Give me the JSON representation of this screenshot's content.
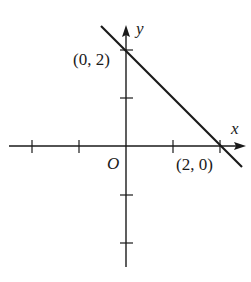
{
  "figure": {
    "type": "coordinate-plane line graph",
    "axes": {
      "x_label": "x",
      "y_label": "y",
      "origin_label": "O"
    },
    "points": [
      {
        "label": "(0, 2)",
        "x": 0,
        "y": 2
      },
      {
        "label": "(2, 0)",
        "x": 2,
        "y": 0
      }
    ],
    "ticks": {
      "x": [
        -2,
        -1,
        1,
        2
      ],
      "y": [
        -2,
        -1,
        1,
        2
      ]
    },
    "line": {
      "equation": "y = -x + 2",
      "color": "#1a1a1a"
    }
  }
}
